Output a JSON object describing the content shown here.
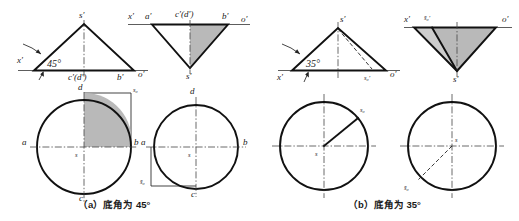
{
  "figure": {
    "background_color": "#ffffff",
    "line_color": "#111111",
    "shade_color": "#b9b9b9",
    "shade_light_color": "#cdcdcd"
  },
  "panels": [
    {
      "id": "panel-a",
      "caption": "（a）底角为 45°",
      "base_angle": "45°",
      "views": [
        {
          "id": "view-a-front",
          "type": "triangle-upright",
          "angle_label": "45°",
          "labels": {
            "apex": "s′",
            "left_axis": "x′",
            "base_center": "c′(d′)",
            "base_right": "b′",
            "axis_right": "o′"
          }
        },
        {
          "id": "view-a-side",
          "type": "triangle-inverted",
          "shaded": true,
          "labels": {
            "axis_left": "x′",
            "top_left": "a′",
            "top_center": "c′(d′)",
            "top_right": "b′",
            "axis_right": "o′",
            "apex_bottom": "s′"
          }
        },
        {
          "id": "view-a-top-left-circle",
          "type": "circle",
          "shaded_quadrant": "upper-right",
          "labels": {
            "top": "d",
            "left": "a",
            "right": "b",
            "bottom": "c",
            "center": "s",
            "dimension": "s₀"
          }
        },
        {
          "id": "view-a-top-right-circle",
          "type": "circle",
          "shaded_quadrant": "none",
          "labels": {
            "top": "d",
            "left": "a",
            "right": "b",
            "bottom": "c",
            "center": "s",
            "dimension": "s̄₀"
          }
        }
      ]
    },
    {
      "id": "panel-b",
      "caption": "（b）底角为 35°",
      "base_angle": "35°",
      "views": [
        {
          "id": "view-b-front",
          "type": "triangle-upright",
          "angle_label": "35°",
          "labels": {
            "apex": "s′",
            "left_axis": "x′",
            "base_mark": "s₀′",
            "axis_right": "o′"
          }
        },
        {
          "id": "view-b-side",
          "type": "triangle-inverted",
          "shaded": true,
          "labels": {
            "axis_left": "x′",
            "top_mark": "s̄₀′",
            "axis_right": "o′",
            "apex_bottom": "s′"
          }
        },
        {
          "id": "view-b-top-left-circle",
          "type": "circle",
          "radius_line": "solid",
          "labels": {
            "center": "s",
            "radius": "s₀"
          }
        },
        {
          "id": "view-b-top-right-circle",
          "type": "circle",
          "radius_line": "dashed",
          "labels": {
            "center": "s",
            "radius": "s̄₀"
          }
        }
      ]
    }
  ]
}
